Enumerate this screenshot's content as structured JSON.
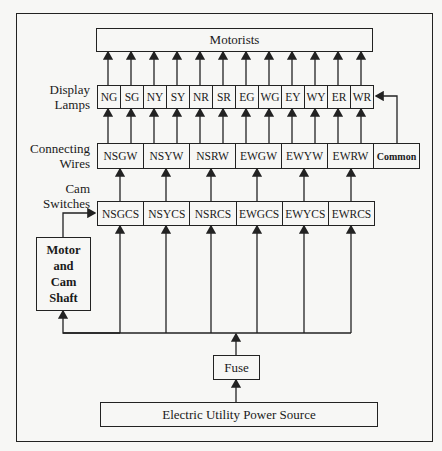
{
  "diagram": {
    "motorists": "Motorists",
    "labels": {
      "display_lamps": [
        "Display",
        "Lamps"
      ],
      "connecting_wires": [
        "Connecting",
        "Wires"
      ],
      "cam_switches": [
        "Cam",
        "Switches"
      ]
    },
    "lamps": [
      "NG",
      "SG",
      "NY",
      "SY",
      "NR",
      "SR",
      "EG",
      "WG",
      "EY",
      "WY",
      "ER",
      "WR"
    ],
    "wires": [
      "NSGW",
      "NSYW",
      "NSRW",
      "EWGW",
      "EWYW",
      "EWRW",
      "Common"
    ],
    "cam_switches": [
      "NSGCS",
      "NSYCS",
      "NSRCS",
      "EWGCS",
      "EWYCS",
      "EWRCS"
    ],
    "motor": [
      "Motor",
      "and",
      "Cam",
      "Shaft"
    ],
    "fuse": "Fuse",
    "power_source": "Electric Utility Power Source"
  }
}
